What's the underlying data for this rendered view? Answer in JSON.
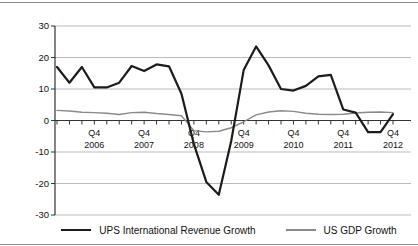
{
  "chart_data": {
    "type": "line",
    "title": "",
    "xlabel": "",
    "ylabel": "",
    "ylim": [
      -30,
      30
    ],
    "y_ticks": [
      30,
      20,
      10,
      0,
      -10,
      -20,
      -30
    ],
    "grid": true,
    "legend_position": "bottom",
    "categories": [
      "Q1 2006",
      "Q2 2006",
      "Q3 2006",
      "Q4 2006",
      "Q1 2007",
      "Q2 2007",
      "Q3 2007",
      "Q4 2007",
      "Q1 2008",
      "Q2 2008",
      "Q3 2008",
      "Q4 2008",
      "Q1 2009",
      "Q2 2009",
      "Q3 2009",
      "Q4 2009",
      "Q1 2010",
      "Q2 2010",
      "Q3 2010",
      "Q4 2010",
      "Q1 2011",
      "Q2 2011",
      "Q3 2011",
      "Q4 2011",
      "Q1 2012",
      "Q2 2012",
      "Q3 2012",
      "Q4 2012"
    ],
    "x_axis_labels": [
      {
        "line1": "Q4",
        "line2": "2006",
        "index": 3
      },
      {
        "line1": "Q4",
        "line2": "2007",
        "index": 7
      },
      {
        "line1": "Q4",
        "line2": "2008",
        "index": 11
      },
      {
        "line1": "Q4",
        "line2": "2009",
        "index": 15
      },
      {
        "line1": "Q4",
        "line2": "2010",
        "index": 19
      },
      {
        "line1": "Q4",
        "line2": "2011",
        "index": 23
      },
      {
        "line1": "Q4",
        "line2": "2012",
        "index": 27
      }
    ],
    "series": [
      {
        "name": "UPS International Revenue Growth",
        "color": "#1c1c1c",
        "stroke_width": 2.2,
        "values": [
          17,
          12,
          17,
          10.5,
          10.5,
          12,
          17.3,
          15.7,
          17.8,
          17.2,
          8.5,
          -7.5,
          -19.5,
          -23.6,
          -6.5,
          16,
          23.5,
          17.5,
          10,
          9.5,
          11,
          14,
          14.5,
          3.5,
          2.5,
          -3.7,
          -3.7,
          2
        ]
      },
      {
        "name": "US GDP Growth",
        "color": "#8a8a8a",
        "stroke_width": 1.4,
        "values": [
          3.2,
          3.0,
          2.6,
          2.5,
          2.3,
          1.9,
          2.5,
          2.6,
          2.2,
          1.9,
          1.5,
          -3.2,
          -3.6,
          -3.4,
          -2.3,
          -0.4,
          1.8,
          2.7,
          3.1,
          2.9,
          2.3,
          2.0,
          1.9,
          2.0,
          2.4,
          2.6,
          2.7,
          2.5
        ]
      }
    ],
    "colors": {
      "grid": "#bbbbbb",
      "axis": "#333333",
      "text": "#111111",
      "background": "#ffffff",
      "frame_rule": "#8c8c8c"
    }
  }
}
